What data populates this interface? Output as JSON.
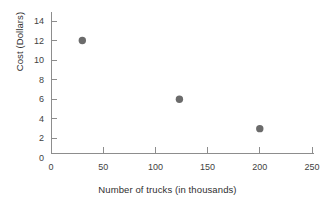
{
  "chart_data": {
    "type": "scatter",
    "title": "",
    "xlabel": "Number of trucks (in thousands)",
    "ylabel": "Cost (Dollars)",
    "xlim": [
      0,
      260
    ],
    "ylim": [
      0,
      15
    ],
    "xticks": [
      0,
      50,
      100,
      150,
      200,
      250
    ],
    "xtick_labels": [
      "0",
      "50",
      "100",
      "150",
      "200",
      "250"
    ],
    "yticks": [
      0,
      2,
      4,
      6,
      8,
      10,
      12,
      14
    ],
    "ytick_labels": [
      "0",
      "2",
      "4",
      "6",
      "8",
      "10",
      "12",
      "14"
    ],
    "grid": false,
    "legend": null,
    "series": [
      {
        "name": "Cost vs trucks",
        "marker": "circle",
        "marker_color": "#6b6b6b",
        "marker_size": 5,
        "points": [
          {
            "x": 30,
            "y": 12
          },
          {
            "x": 123,
            "y": 6
          },
          {
            "x": 200,
            "y": 3
          }
        ]
      }
    ],
    "axis_color": "#8d8d8d",
    "text_color": "#3f3f3f",
    "background": "#ffffff"
  }
}
